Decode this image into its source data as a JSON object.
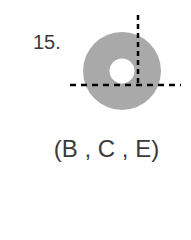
{
  "problem": {
    "number": "15.",
    "answer": "(B , C , E)"
  },
  "figure": {
    "shape": "annulus",
    "fill_color": "#a9a9a9",
    "hole_color": "#ffffff",
    "axis_color": "#000000"
  }
}
